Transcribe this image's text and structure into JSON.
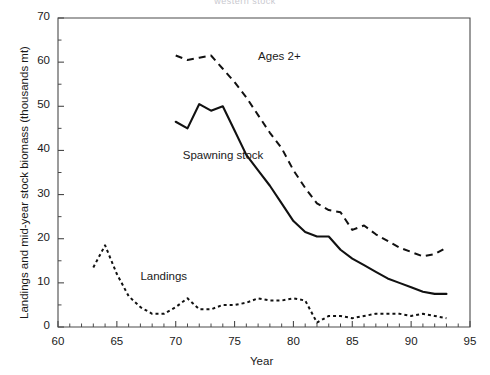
{
  "chart_data": {
    "type": "line",
    "title": "western stock",
    "xlabel": "Year",
    "ylabel": "Landings and mid-year stock biomass (thousands mt)",
    "xlim": [
      60,
      95
    ],
    "ylim": [
      0,
      70
    ],
    "xticks": [
      60,
      65,
      70,
      75,
      80,
      85,
      90,
      95
    ],
    "yticks": [
      0,
      10,
      20,
      30,
      40,
      50,
      60,
      70
    ],
    "x_minor_step": 1,
    "y_minor_step": 5,
    "grid": false,
    "legend": "inline-annotations",
    "annotations": [
      {
        "text": "Ages 2+",
        "x": 77.0,
        "y": 61.0
      },
      {
        "text": "Spawning stock",
        "x": 70.6,
        "y": 38.5
      },
      {
        "text": "Landings",
        "x": 67.0,
        "y": 11.0
      }
    ],
    "series": [
      {
        "name": "Ages 2+",
        "style": "dashed",
        "x": [
          70,
          71,
          72,
          73,
          74,
          75,
          76,
          77,
          78,
          79,
          80,
          81,
          82,
          83,
          84,
          85,
          86,
          87,
          88,
          89,
          90,
          91,
          92,
          93
        ],
        "values": [
          61.5,
          60.5,
          61.0,
          61.5,
          58.5,
          55.5,
          52.0,
          48.0,
          44.0,
          40.5,
          35.5,
          31.5,
          28.0,
          26.5,
          26.0,
          22.0,
          23.0,
          21.0,
          19.5,
          18.0,
          17.0,
          16.0,
          16.5,
          18.0
        ]
      },
      {
        "name": "Spawning stock",
        "style": "solid",
        "x": [
          70,
          71,
          72,
          73,
          74,
          75,
          76,
          77,
          78,
          79,
          80,
          81,
          82,
          83,
          84,
          85,
          86,
          87,
          88,
          89,
          90,
          91,
          92,
          93
        ],
        "values": [
          46.5,
          45.0,
          50.5,
          49.0,
          50.0,
          44.5,
          39.0,
          35.5,
          32.0,
          28.0,
          24.0,
          21.5,
          20.5,
          20.5,
          17.5,
          15.5,
          14.0,
          12.5,
          11.0,
          10.0,
          9.0,
          8.0,
          7.5,
          7.5
        ]
      },
      {
        "name": "Landings",
        "style": "dotted",
        "x": [
          63,
          64,
          65,
          66,
          67,
          68,
          69,
          70,
          71,
          72,
          73,
          74,
          75,
          76,
          77,
          78,
          79,
          80,
          81,
          82,
          83,
          84,
          85,
          86,
          87,
          88,
          89,
          90,
          91,
          92,
          93
        ],
        "values": [
          13.5,
          18.5,
          12.0,
          7.0,
          4.5,
          3.0,
          3.0,
          4.5,
          6.5,
          4.0,
          4.0,
          5.0,
          5.0,
          5.5,
          6.5,
          6.0,
          6.0,
          6.5,
          6.0,
          1.0,
          2.5,
          2.5,
          2.0,
          2.5,
          3.0,
          3.0,
          3.0,
          2.5,
          3.0,
          2.5,
          2.0
        ]
      }
    ]
  }
}
